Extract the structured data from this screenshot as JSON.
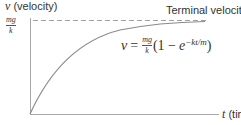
{
  "diagram": {
    "title": "",
    "y_axis": {
      "variable": "v",
      "label": "(velocity)"
    },
    "x_axis": {
      "variable": "t",
      "label": "(tim"
    },
    "asymptote": {
      "label": "Terminal velocity",
      "value_label": {
        "numerator": "mg",
        "denominator": "k"
      },
      "style": "dashed"
    },
    "equation": {
      "lhs": "v",
      "equals": "=",
      "fraction": {
        "numerator": "mg",
        "denominator": "k"
      },
      "open": "(1 −",
      "base": "e",
      "exponent": "−kt/m",
      "close": ")"
    },
    "curve": "v = (mg/k)(1 − e^(−kt/m)), starting at origin and approaching terminal velocity asymptotically",
    "colors": {
      "axis": "#999999",
      "curve": "#888888",
      "dashed": "#999999",
      "text": "#333333"
    }
  }
}
